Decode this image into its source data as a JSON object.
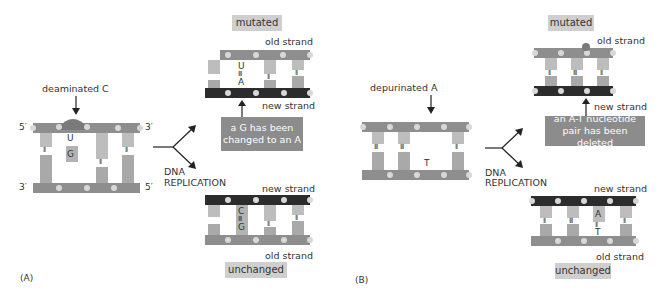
{
  "panel_a": {
    "label": "(A)",
    "damage_label": "deaminated C",
    "left_5": "5′",
    "left_3": "3′",
    "right_3": "3′",
    "right_5": "5′",
    "damaged_base": "U",
    "partner_base": "G",
    "replication_label_1": "DNA",
    "replication_label_2": "REPLICATION",
    "top": {
      "tag": "mutated",
      "old_strand": "old strand",
      "new_strand": "new strand",
      "base_top": "U",
      "base_bottom": "A",
      "note_line1": "a G has been",
      "note_line2": "changed to an A"
    },
    "bottom": {
      "tag": "unchanged",
      "new_strand": "new strand",
      "old_strand": "old strand",
      "base_top": "C",
      "base_bottom": "G"
    }
  },
  "panel_b": {
    "label": "(B)",
    "damage_label": "depurinated A",
    "partner_base": "T",
    "replication_label_1": "DNA",
    "replication_label_2": "REPLICATION",
    "top": {
      "tag": "mutated",
      "old_strand": "old strand",
      "new_strand": "new strand",
      "note_line1": "an A-T nucleotide",
      "note_line2": "pair has been deleted"
    },
    "bottom": {
      "tag": "unchanged",
      "new_strand": "new strand",
      "old_strand": "old strand",
      "base_top": "A",
      "base_bottom": "T"
    }
  },
  "colors": {
    "old_strand": "#8e8e8e",
    "new_strand": "#2c2c2c",
    "tag_bg": "#cfcfcf",
    "note_bg": "#8c8c8c"
  }
}
